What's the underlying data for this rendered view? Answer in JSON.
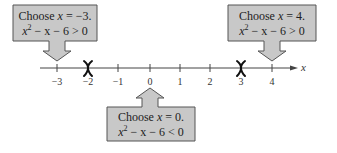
{
  "number_line": {
    "variable": "x",
    "ticks": [
      "−3",
      "−2",
      "−1",
      "0",
      "1",
      "2",
      "3",
      "4"
    ],
    "critical_points": [
      "−2",
      "3"
    ]
  },
  "callouts": {
    "left": {
      "line1_prefix": "Choose ",
      "line1_var": "x",
      "line1_suffix": " = −3.",
      "line2_var": "x",
      "line2_exp": "2",
      "line2_rest": " − x − 6 > 0",
      "points_to": "−3"
    },
    "right": {
      "line1_prefix": "Choose ",
      "line1_var": "x",
      "line1_suffix": " = 4.",
      "line2_var": "x",
      "line2_exp": "2",
      "line2_rest": " − x − 6 > 0",
      "points_to": "4"
    },
    "bottom": {
      "line1_prefix": "Choose ",
      "line1_var": "x",
      "line1_suffix": " = 0.",
      "line2_var": "x",
      "line2_exp": "2",
      "line2_rest": " − x − 6 < 0",
      "points_to": "0"
    }
  },
  "colors": {
    "box_fill": "#c8c8c8",
    "box_stroke": "#555555",
    "axis": "#444444",
    "marker": "#111111"
  }
}
